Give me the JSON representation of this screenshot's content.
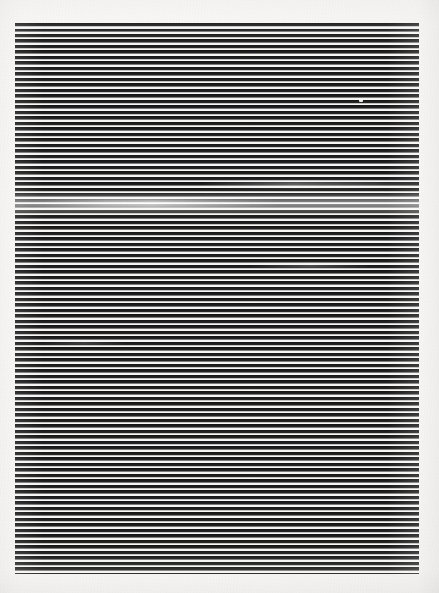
{
  "artwork": {
    "title": "Horizontal Line Field",
    "medium_appearance": "ink lines on off-white paper",
    "caption": "",
    "background_color": "#f6f5f3",
    "line_color": "#141414",
    "paper_highlight_color": "#fbfafa"
  },
  "canvas": {
    "width": 439,
    "height": 593
  },
  "stripe_block": {
    "left": 15,
    "top": 23,
    "width": 404,
    "height": 551,
    "orientation": "horizontal",
    "line_period_px": 5.5,
    "line_thickness_px": 3,
    "gap_thickness_px": 2.5,
    "line_count": 100
  },
  "artifacts": {
    "crease": {
      "label": "soft horizontal crease",
      "top": 168,
      "height": 26
    },
    "speck": {
      "label": "light dust speck",
      "left": 344,
      "top": 76
    }
  },
  "chart_data": {
    "type": "bar",
    "title": "Horizontal Line Field",
    "xlabel": "",
    "ylabel": "",
    "categories": [],
    "values": []
  }
}
